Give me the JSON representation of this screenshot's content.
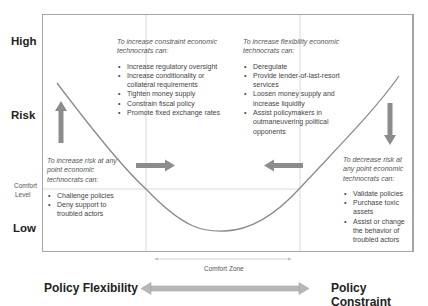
{
  "y_axis": {
    "high": "High",
    "risk": "Risk",
    "comfort_level": [
      "Comfort",
      "Level"
    ],
    "low": "Low"
  },
  "x_axis": {
    "left": "Policy Flexibility",
    "right": "Policy Constraint",
    "comfort_zone": "Comfort Zone"
  },
  "boxes": {
    "constraint": {
      "header": "To increase constraint economic technocrats can:",
      "items": [
        "Increase regulatory oversight",
        "Increase conditionality or collateral requirements",
        "Tighten money supply",
        "Constrain fiscal policy",
        "Promote fixed exchange rates"
      ]
    },
    "flexibility": {
      "header": "To increase flexibility economic technocrats can:",
      "items": [
        "Deregulate",
        "Provide lender-of-last-resort services",
        "Loosen money supply and increase liquidity",
        "Assist policymakers in outmaneuvering political opponents"
      ]
    },
    "increase_risk": {
      "header": "To increase risk at any point economic technocrats can:",
      "items": [
        "Challenge policies",
        "Deny support to troubled actors"
      ]
    },
    "decrease_risk": {
      "header": "To decrease risk at any point economic technocrats can:",
      "items": [
        "Validate policies",
        "Purchase toxic assets",
        "Assist or change the behavior of troubled actors"
      ]
    }
  },
  "colors": {
    "frame": "#a6a6a6",
    "arrow": "#8c8c8c",
    "curve": "#8a8a8a",
    "gridline": "#d9d9d9"
  }
}
